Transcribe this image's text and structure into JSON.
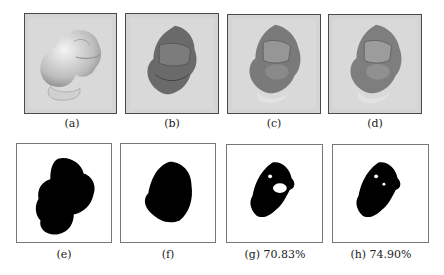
{
  "figure": {
    "panels": [
      {
        "id": "a",
        "caption": "(a)",
        "kind": "render",
        "shade": "light"
      },
      {
        "id": "b",
        "caption": "(b)",
        "kind": "render",
        "shade": "dark"
      },
      {
        "id": "c",
        "caption": "(c)",
        "kind": "render",
        "shade": "mixed"
      },
      {
        "id": "d",
        "caption": "(d)",
        "kind": "render",
        "shade": "mixed"
      },
      {
        "id": "e",
        "caption": "(e)",
        "kind": "silhouette"
      },
      {
        "id": "f",
        "caption": "(f)",
        "kind": "silhouette"
      },
      {
        "id": "g",
        "caption": "(g) 70.83%",
        "kind": "mask"
      },
      {
        "id": "h",
        "caption": "(h) 74.90%",
        "kind": "mask"
      }
    ]
  }
}
